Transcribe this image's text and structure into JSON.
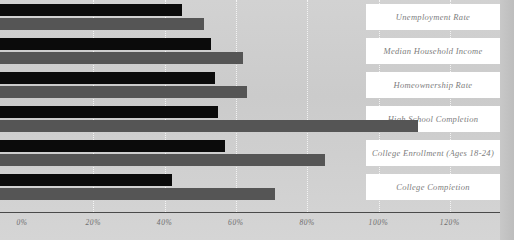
{
  "chart_data": {
    "type": "bar",
    "orientation": "horizontal",
    "title": "",
    "xlabel": "",
    "ylabel": "",
    "xlim": [
      0,
      125
    ],
    "xticks": [
      0,
      20,
      40,
      60,
      80,
      100,
      120
    ],
    "xtick_labels": [
      "0%",
      "20%",
      "40%",
      "60%",
      "80%",
      "100%",
      "120%"
    ],
    "grid": true,
    "grid_axis": "x",
    "legend": "none",
    "categories": [
      "Unemployment Rate",
      "Median Household Income",
      "Homeownership Rate",
      "High School Completion",
      "College Enrollment (Ages 18-24)",
      "College Completion"
    ],
    "series": [
      {
        "name": "series-1",
        "color": "#0b0b0b",
        "values": [
          45,
          53,
          54,
          55,
          57,
          42
        ]
      },
      {
        "name": "series-2",
        "color": "#555555",
        "values": [
          51,
          62,
          63,
          111,
          85,
          71
        ]
      }
    ]
  },
  "colors": {
    "background": "#cfcfcf",
    "label_box": "#ffffff",
    "axis": "#4a4a4a",
    "gridline": "#ffffff",
    "series_1": "#0b0b0b",
    "series_2": "#555555",
    "tick_text": "#6e6e6e",
    "label_text": "#7d7d7d"
  }
}
